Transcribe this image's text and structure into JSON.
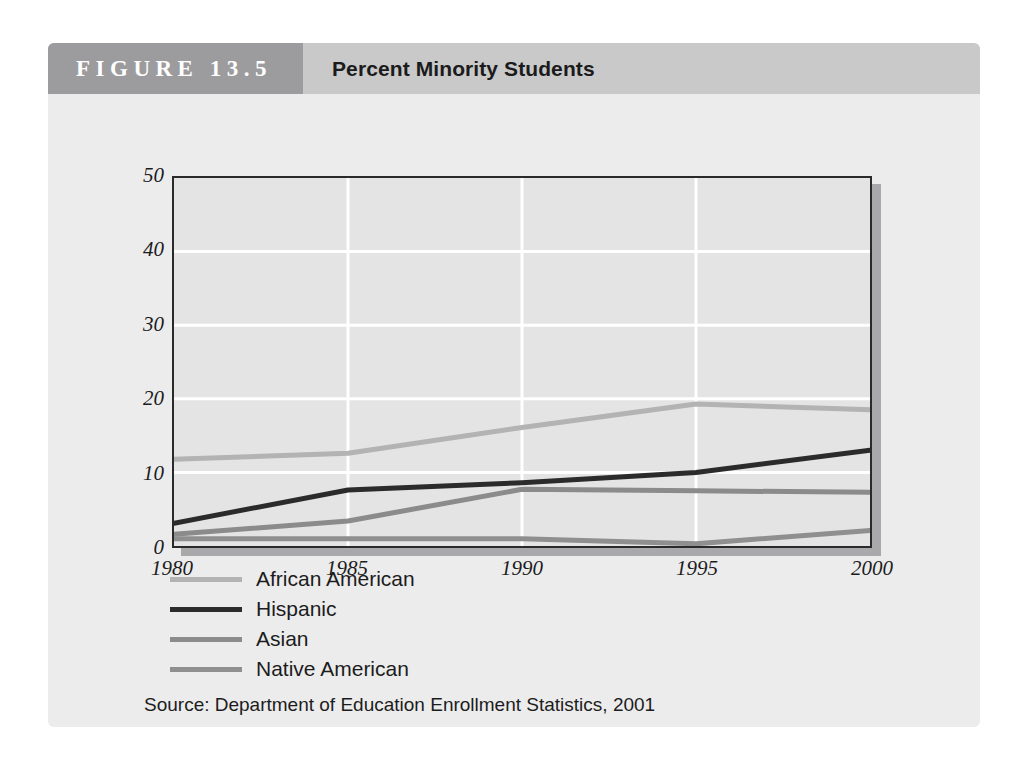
{
  "figure": {
    "number_label": "FIGURE 13.5",
    "title": "Percent Minority Students",
    "source": "Source: Department of Education Enrollment Statistics, 2001"
  },
  "colors": {
    "header_band": "#c9c9ca",
    "header_number_block": "#9c9c9e",
    "card_background": "#ececed",
    "plot_background": "#e4e4e5",
    "plot_border": "#2a2a2a",
    "plot_shadow": "#a9a9ab",
    "gridline": "#ffffff",
    "african_american": "#b3b3b4",
    "hispanic": "#2b2b2b",
    "asian": "#8b8b8c",
    "native_american": "#8f8f90"
  },
  "chart_data": {
    "type": "line",
    "title": "Percent Minority Students",
    "xlabel": "",
    "ylabel": "",
    "x": [
      1980,
      1985,
      1990,
      1995,
      2000
    ],
    "xtick_labels": [
      "1980",
      "1985",
      "1990",
      "1995",
      "2000"
    ],
    "ytick_labels": [
      "0",
      "10",
      "20",
      "30",
      "40",
      "50"
    ],
    "yticks": [
      0,
      10,
      20,
      30,
      40,
      50
    ],
    "xlim": [
      1980,
      2000
    ],
    "ylim": [
      0,
      50
    ],
    "grid": true,
    "legend_position": "below-left",
    "series": [
      {
        "name": "African American",
        "color": "#b3b3b4",
        "width": 5,
        "values": [
          11.8,
          12.6,
          16.1,
          19.3,
          18.5
        ]
      },
      {
        "name": "Hispanic",
        "color": "#2b2b2b",
        "width": 5,
        "values": [
          3.1,
          7.6,
          8.6,
          10.0,
          13.0
        ]
      },
      {
        "name": "Asian",
        "color": "#8b8b8c",
        "width": 5,
        "values": [
          1.6,
          3.4,
          7.7,
          7.5,
          7.3
        ]
      },
      {
        "name": "Native American",
        "color": "#8f8f90",
        "width": 5,
        "values": [
          1.0,
          1.0,
          1.0,
          0.3,
          2.1
        ]
      }
    ]
  }
}
